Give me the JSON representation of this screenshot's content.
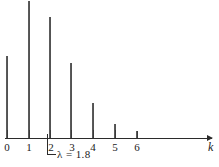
{
  "figure": {
    "background_color": "#ffffff",
    "line_color": "#2b2b2b",
    "stem_color": "#4a4a4a"
  },
  "chart_data": {
    "type": "bar",
    "title": "",
    "subtitle": "",
    "xlabel": "k",
    "ylabel": "",
    "categories": [
      "0",
      "1",
      "2",
      "3",
      "4",
      "5",
      "6"
    ],
    "x": [
      0,
      1,
      2,
      3,
      4,
      5,
      6
    ],
    "values": [
      0.1653,
      0.2975,
      0.2678,
      0.1607,
      0.0723,
      0.026,
      0.0078
    ],
    "pixel_heights": [
      82,
      137,
      121,
      75,
      35,
      14,
      7
    ],
    "xlim": [
      -0.35,
      9.6
    ],
    "ylim": [
      0,
      0.3
    ],
    "grid": false,
    "legend": null,
    "annotations": [
      {
        "text": "λ  =  1.8",
        "anchor_x": 2,
        "note": "L-shaped leader line from axis at k = 2"
      }
    ],
    "distribution": "Poisson",
    "parameter_lambda": 1.8
  },
  "axis": {
    "name_label": "k",
    "tick_labels": [
      "0",
      "1",
      "2",
      "3",
      "4",
      "5",
      "6"
    ],
    "arrow_icon": "right-arrow-icon"
  },
  "annotation": {
    "lambda_symbol": "λ",
    "equals": "=",
    "value": "1.8",
    "full_text": "λ  =  1.8"
  }
}
